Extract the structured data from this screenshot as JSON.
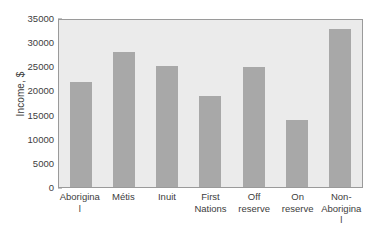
{
  "chart_data": {
    "type": "bar",
    "title": "",
    "subtitle": "",
    "xlabel": "",
    "ylabel": "Income, $",
    "categories": [
      "Aboriginal",
      "Métis",
      "Inuit",
      "First Nations",
      "Off reserve",
      "On reserve",
      "Non-Aboriginal"
    ],
    "values": [
      22000,
      28200,
      25300,
      19000,
      25200,
      14000,
      33200
    ],
    "ylim": [
      0,
      35000
    ],
    "yticks": [
      0,
      5000,
      10000,
      15000,
      20000,
      25000,
      30000,
      35000
    ],
    "ytick_labels": [
      "0",
      "5000",
      "10000",
      "15000",
      "20000",
      "25000",
      "30000",
      "35000"
    ],
    "grid": false,
    "legend": null,
    "legend_position": "none",
    "annotations": [],
    "colors": {
      "bar_fill": "#a8a8a8",
      "plot_background": "#ebebeb",
      "figure_background": "#ffffff",
      "axis_border": "#9a9a9a",
      "text": "#3d3d3d"
    }
  }
}
